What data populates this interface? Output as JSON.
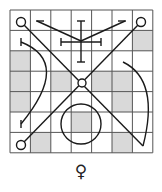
{
  "diagram": {
    "type": "magic-square-sigil",
    "grid": {
      "rows": 7,
      "cols": 7,
      "origin_x": 10,
      "origin_y": 10,
      "cell_size": 20.4,
      "line_color": "#555555",
      "shade_color": "#d9d9d9",
      "shaded_cells": [
        {
          "row": 2,
          "col": 7
        },
        {
          "row": 3,
          "col": 1
        },
        {
          "row": 4,
          "col": 1
        },
        {
          "row": 4,
          "col": 3
        },
        {
          "row": 4,
          "col": 5
        },
        {
          "row": 4,
          "col": 6
        },
        {
          "row": 5,
          "col": 1
        },
        {
          "row": 5,
          "col": 6
        },
        {
          "row": 6,
          "col": 4
        },
        {
          "row": 7,
          "col": 2
        },
        {
          "row": 7,
          "col": 6
        }
      ]
    },
    "sigil": {
      "stroke_color": "#1a1a1a",
      "end_circles": [
        {
          "cx": 21,
          "cy": 22,
          "r": 4.5
        },
        {
          "cx": 141,
          "cy": 22,
          "r": 4.5
        },
        {
          "cx": 21,
          "cy": 145,
          "r": 4.5
        },
        {
          "cx": 82,
          "cy": 83,
          "r": 4
        }
      ],
      "center_circle": {
        "cx": 81,
        "cy": 124,
        "r": 20
      }
    },
    "planet_symbol": "♀",
    "planet_name": "Venus"
  }
}
